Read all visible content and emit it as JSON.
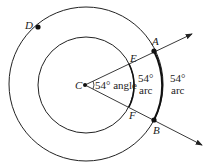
{
  "diagram": {
    "points": {
      "C": {
        "label": "C",
        "x": 85,
        "y": 85
      },
      "A": {
        "label": "A",
        "x": 154,
        "y": 51
      },
      "B": {
        "label": "B",
        "x": 154,
        "y": 120
      },
      "D": {
        "label": "D",
        "x": 38,
        "y": 27
      },
      "E": {
        "label": "E"
      },
      "F": {
        "label": "F"
      }
    },
    "circles": {
      "outer": {
        "cx": 86,
        "cy": 84,
        "r": 77
      },
      "inner": {
        "cx": 86,
        "cy": 85,
        "r": 48
      }
    },
    "annotations": {
      "angle": "54° angle",
      "inner_arc_deg": "54°",
      "inner_arc_word": "arc",
      "outer_arc_deg": "54°",
      "outer_arc_word": "arc"
    },
    "colors": {
      "stroke": "#222222"
    }
  }
}
